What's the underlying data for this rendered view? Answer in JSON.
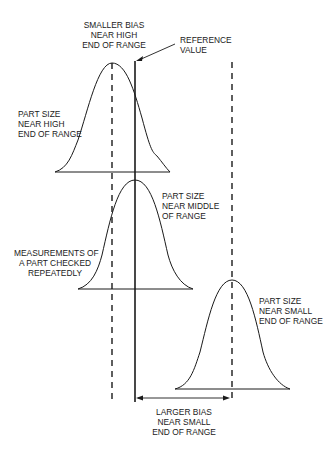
{
  "diagram": {
    "labels": {
      "smaller_bias": "SMALLER BIAS\nNEAR HIGH\nEND OF RANGE",
      "reference_value": "REFERENCE\nVALUE",
      "part_high": "PART SIZE\nNEAR HIGH\nEND OF RANGE",
      "part_middle": "PART SIZE\nNEAR MIDDLE\nOF RANGE",
      "measurements": "MEASUREMENTS OF\nA PART CHECKED\nREPEATEDLY",
      "part_small": "PART SIZE\nNEAR SMALL\nEND OF RANGE",
      "larger_bias": "LARGER BIAS\nNEAR SMALL\nEND OF RANGE"
    },
    "colors": {
      "line": "#1a1a1a",
      "background": "#ffffff"
    }
  }
}
